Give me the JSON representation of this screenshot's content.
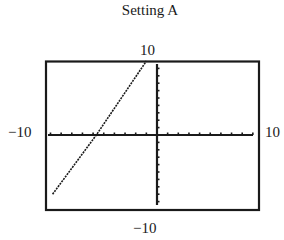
{
  "chart_data": {
    "type": "line",
    "title": "Setting A",
    "xlabel": "",
    "ylabel": "",
    "xlim": [
      -10,
      10
    ],
    "ylim": [
      -10,
      10
    ],
    "window_labels": {
      "ymax": "10",
      "ymin": "−10",
      "xmin": "−10",
      "xmax": "10"
    },
    "grid": false,
    "x_tick_spacing": 1,
    "y_tick_spacing": 1,
    "series": [
      {
        "name": "graph",
        "x": [
          -9.8,
          -5.7,
          -1.0
        ],
        "y": [
          -8.0,
          0.0,
          10.0
        ]
      }
    ]
  },
  "labels": {
    "title": "Setting A",
    "top": "10",
    "left": "−10",
    "right": "10",
    "bottom": "−10"
  },
  "colors": {
    "ink": "#1a1a1a",
    "background": "#ffffff"
  }
}
